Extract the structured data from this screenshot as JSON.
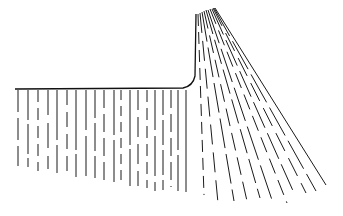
{
  "diagram": {
    "outline": {
      "start": [
        15,
        89
      ],
      "corner": [
        186,
        88
      ],
      "top": [
        196,
        14
      ]
    },
    "vertical_lines": [
      {
        "x": 18,
        "y2": 166,
        "dash": "22 6"
      },
      {
        "x": 28,
        "y2": 167,
        "dash": "30 4"
      },
      {
        "x": 38,
        "y2": 171,
        "dash": "12 6"
      },
      {
        "x": 48,
        "y2": 169,
        "dash": "25 8"
      },
      {
        "x": 57,
        "y2": 173,
        "dash": "50 5"
      },
      {
        "x": 67,
        "y2": 176,
        "dash": "15 7"
      },
      {
        "x": 76,
        "y2": 177,
        "dash": "60 4"
      },
      {
        "x": 86,
        "y2": 178,
        "dash": "40 6"
      },
      {
        "x": 95,
        "y2": 178,
        "dash": "28 5"
      },
      {
        "x": 104,
        "y2": 181,
        "dash": "18 6"
      },
      {
        "x": 114,
        "y2": 182,
        "dash": "45 5"
      },
      {
        "x": 121,
        "y2": 184,
        "dash": "10 6"
      },
      {
        "x": 130,
        "y2": 186,
        "dash": "55 4"
      },
      {
        "x": 138,
        "y2": 186,
        "dash": "20 7"
      },
      {
        "x": 147,
        "y2": 188,
        "dash": "12 6"
      },
      {
        "x": 155,
        "y2": 191,
        "dash": "40 6"
      },
      {
        "x": 163,
        "y2": 190,
        "dash": "25 5"
      },
      {
        "x": 171,
        "y2": 187,
        "dash": "18 6"
      },
      {
        "x": 178,
        "y2": 191,
        "dash": "60 5"
      },
      {
        "x": 186,
        "y2": 192,
        "dash": "100 0"
      }
    ],
    "fan_lines": [
      {
        "x1": 198,
        "y1": 14,
        "x2": 204,
        "y2": 195,
        "dash": "12 6"
      },
      {
        "x1": 200,
        "y1": 13,
        "x2": 218,
        "y2": 203,
        "dash": "20 8"
      },
      {
        "x1": 202,
        "y1": 12,
        "x2": 234,
        "y2": 201,
        "dash": "30 6"
      },
      {
        "x1": 204,
        "y1": 11,
        "x2": 247,
        "y2": 201,
        "dash": "18 7"
      },
      {
        "x1": 206,
        "y1": 10,
        "x2": 260,
        "y2": 198,
        "dash": "25 6"
      },
      {
        "x1": 208,
        "y1": 10,
        "x2": 272,
        "y2": 200,
        "dash": "35 6"
      },
      {
        "x1": 210,
        "y1": 9,
        "x2": 287,
        "y2": 203,
        "dash": "16 7"
      },
      {
        "x1": 212,
        "y1": 9,
        "x2": 294,
        "y2": 193,
        "dash": "28 6"
      },
      {
        "x1": 213,
        "y1": 8,
        "x2": 306,
        "y2": 193,
        "dash": "20 8"
      },
      {
        "x1": 214,
        "y1": 8,
        "x2": 316,
        "y2": 191,
        "dash": "32 6"
      },
      {
        "x1": 215,
        "y1": 8,
        "x2": 326,
        "y2": 185,
        "dash": "300 0"
      }
    ]
  }
}
